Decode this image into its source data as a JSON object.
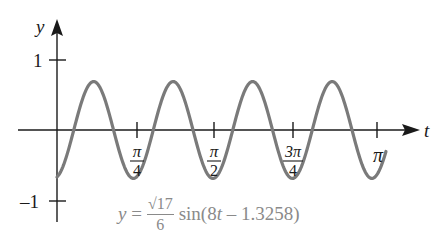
{
  "chart_data": {
    "type": "line",
    "title": "",
    "xlabel": "t",
    "ylabel": "y",
    "equation": {
      "lhs": "y =",
      "coef_numerator": "√17",
      "coef_denominator": "6",
      "func": "sin(8t – 1.3258)",
      "amplitude": 0.6872,
      "angular_frequency": 8,
      "phase_shift": 1.3258
    },
    "x_ticks": [
      {
        "value": 0.7854,
        "num": "π",
        "den": "4"
      },
      {
        "value": 1.5708,
        "num": "π",
        "den": "2"
      },
      {
        "value": 2.3562,
        "num": "3π",
        "den": "4"
      },
      {
        "value": 3.1416,
        "label": "π"
      }
    ],
    "y_ticks": [
      {
        "value": 1,
        "label": "1"
      },
      {
        "value": -1,
        "label": "–1"
      }
    ],
    "xlim": [
      0,
      3.25
    ],
    "ylim": [
      -1.1,
      1.2
    ],
    "grid": false,
    "legend": "none",
    "series": [
      {
        "name": "y = (√17/6) sin(8t − 1.3258)",
        "color": "#7a7a7a",
        "x": [
          0,
          0.1657,
          0.3621,
          0.5584,
          0.7548,
          0.9511,
          1.1475,
          1.3438,
          1.5402,
          1.7365,
          1.9329,
          2.1292,
          2.3256,
          2.5219,
          2.7183,
          2.9146,
          3.111,
          3.24
        ],
        "y": [
          -0.669,
          0,
          0.687,
          0,
          -0.687,
          0,
          0.687,
          0,
          -0.687,
          0,
          0.687,
          0,
          -0.687,
          0,
          0.687,
          0,
          -0.687,
          -0.56
        ]
      }
    ]
  },
  "formula": {
    "lhs": "y =",
    "num": "√17",
    "den": "6",
    "rhs_pre": "sin(8",
    "rhs_var": "t",
    "rhs_post": " – 1.3258)"
  },
  "axes": {
    "x_label": "t",
    "y_label": "y",
    "y_tick_1": "1",
    "y_tick_m1": "–1",
    "x_tick_pi": "π",
    "pi_over_4_num": "π",
    "pi_over_4_den": "4",
    "pi_over_2_num": "π",
    "pi_over_2_den": "2",
    "three_pi_over_4_num": "3π",
    "three_pi_over_4_den": "4"
  },
  "colors": {
    "axis": "#1a1a1a",
    "curve": "#7a7a7a",
    "formula": "#8a8a8a"
  }
}
